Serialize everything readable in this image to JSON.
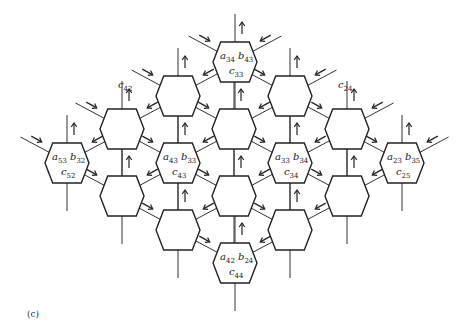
{
  "caption": "(c)",
  "hex": {
    "w": 44,
    "h": 40
  },
  "cells": [
    {
      "id": "r1c1",
      "x": 235,
      "y": 62,
      "a": "a",
      "a_sub": "34",
      "b": "b",
      "b_sub": "43",
      "c": "c",
      "c_sub": "33"
    },
    {
      "id": "r2c1",
      "x": 178,
      "y": 96
    },
    {
      "id": "r2c2",
      "x": 290,
      "y": 96
    },
    {
      "id": "r3c1",
      "x": 122,
      "y": 129
    },
    {
      "id": "r3c2",
      "x": 234,
      "y": 129
    },
    {
      "id": "r3c3",
      "x": 347,
      "y": 129
    },
    {
      "id": "r4c1",
      "x": 67,
      "y": 163,
      "a": "a",
      "a_sub": "53",
      "b": "b",
      "b_sub": "32",
      "c": "c",
      "c_sub": "52"
    },
    {
      "id": "r4c2",
      "x": 178,
      "y": 163,
      "a": "a",
      "a_sub": "43",
      "b": "b",
      "b_sub": "33",
      "c": "c",
      "c_sub": "43"
    },
    {
      "id": "r4c3",
      "x": 290,
      "y": 163,
      "a": "a",
      "a_sub": "33",
      "b": "b",
      "b_sub": "34",
      "c": "c",
      "c_sub": "34"
    },
    {
      "id": "r4c4",
      "x": 402,
      "y": 163,
      "a": "a",
      "a_sub": "23",
      "b": "b",
      "b_sub": "35",
      "c": "c",
      "c_sub": "25"
    },
    {
      "id": "r5c1",
      "x": 122,
      "y": 196
    },
    {
      "id": "r5c2",
      "x": 234,
      "y": 196
    },
    {
      "id": "r5c3",
      "x": 347,
      "y": 196
    },
    {
      "id": "r6c1",
      "x": 178,
      "y": 230
    },
    {
      "id": "r6c2",
      "x": 290,
      "y": 230
    },
    {
      "id": "r7c1",
      "x": 235,
      "y": 263,
      "a": "a",
      "a_sub": "42",
      "b": "b",
      "b_sub": "24",
      "c": "c",
      "c_sub": "44"
    }
  ],
  "output_labels": [
    {
      "text": "c",
      "sub": "42",
      "x": 118,
      "y": 88
    },
    {
      "text": "c",
      "sub": "24",
      "x": 338,
      "y": 88
    }
  ]
}
